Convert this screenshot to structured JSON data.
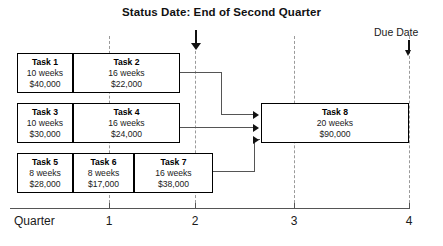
{
  "title": "Status Date: End of Second Quarter",
  "due_date": {
    "label": "Due Date"
  },
  "axis": {
    "caption": "Quarter",
    "ticks": [
      {
        "label": "1",
        "x": 109
      },
      {
        "label": "2",
        "x": 195
      },
      {
        "label": "3",
        "x": 294
      },
      {
        "label": "4",
        "x": 409
      }
    ]
  },
  "gridlines": [
    109,
    195,
    294,
    409
  ],
  "rows": [
    {
      "id": "row-1",
      "top": 53,
      "height": 40,
      "tasks": [
        {
          "name": "Task 1",
          "duration": "10 weeks",
          "cost": "$40,000",
          "left": 17,
          "width": 56
        },
        {
          "name": "Task 2",
          "duration": "16 weeks",
          "cost": "$22,000",
          "left": 73,
          "width": 107
        }
      ]
    },
    {
      "id": "row-2",
      "top": 103,
      "height": 40,
      "tasks": [
        {
          "name": "Task 3",
          "duration": "10 weeks",
          "cost": "$30,000",
          "left": 17,
          "width": 56
        },
        {
          "name": "Task 4",
          "duration": "16 weeks",
          "cost": "$24,000",
          "left": 73,
          "width": 107
        }
      ]
    },
    {
      "id": "row-3",
      "top": 153,
      "height": 40,
      "tasks": [
        {
          "name": "Task 5",
          "duration": "8 weeks",
          "cost": "$28,000",
          "left": 17,
          "width": 56
        },
        {
          "name": "Task 6",
          "duration": "8 weeks",
          "cost": "$17,000",
          "left": 73,
          "width": 61
        },
        {
          "name": "Task 7",
          "duration": "16 weeks",
          "cost": "$38,000",
          "left": 134,
          "width": 79
        }
      ]
    }
  ],
  "final_task": {
    "name": "Task 8",
    "duration": "20 weeks",
    "cost": "$90,000",
    "left": 261,
    "top": 103,
    "width": 148,
    "height": 40
  },
  "colors": {
    "box_border": "#000000",
    "connector": "#555555",
    "gridline": "#9a9a9a",
    "text": "#1a1a1a",
    "background": "#ffffff"
  }
}
